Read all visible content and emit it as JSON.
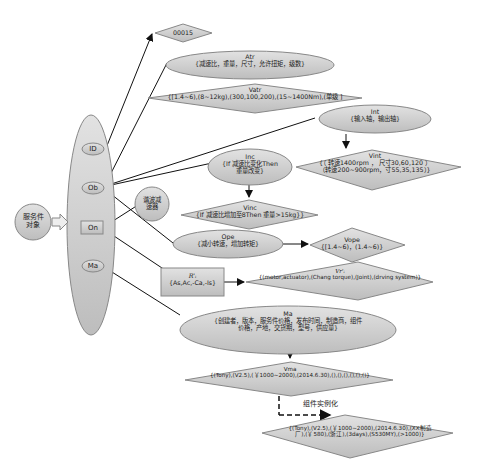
{
  "root": {
    "label": "服务件\n对象",
    "line1": "服务件",
    "line2": "对象"
  },
  "attributes_container": {
    "items": [
      {
        "key": "ID",
        "label": "ID"
      },
      {
        "key": "Ob",
        "label": "Ob"
      },
      {
        "key": "On",
        "label": "On"
      },
      {
        "key": "Ma",
        "label": "Ma"
      }
    ]
  },
  "id_value": {
    "label": "00015"
  },
  "on_value": {
    "line1": "谐波减",
    "line2": "速器"
  },
  "atr": {
    "title": "Atr",
    "text": "{减速比，重量，尺寸，允许扭矩，级数}"
  },
  "vatr": {
    "title": "Vatr",
    "text": "{[1.4~6),(8~12kg),(300,100,200),(15~1400Nm),(单级 ]"
  },
  "int": {
    "title": "Int",
    "text": "{输入轴，输出轴}"
  },
  "vint": {
    "title": "Vint",
    "line1": "{（ 转速1400rpm ， 尺寸30,60,120 ）",
    "line2": "（转速200~900rpm，寸55,35,135）}"
  },
  "inc": {
    "title": "Inc",
    "line1": "{If 减速比变化Then",
    "line2": "重量改变}"
  },
  "vinc": {
    "title": "Vinc",
    "text": "{If 减速比增加至8Then 重量>15kg}}"
  },
  "ope": {
    "title": "Ope",
    "text": "{减小转速，增加转矩}"
  },
  "vope": {
    "title": "Vope",
    "text": "{[1.4~6)，(1.4~6)}"
  },
  "r": {
    "title": "R'ᵢ",
    "text": "{As,Ac,-Ca,-Is}"
  },
  "vr": {
    "title": "Vr'ᵢ",
    "text": "{(motor,actuator),(Chang torque),(Joint),(drving system)}"
  },
  "ma": {
    "title": "Ma",
    "line1": "{创建者，版本，服务件价格，发布时间，制造商，组件",
    "line2": "价格，产地，交货期，型号，供应量}"
  },
  "vma": {
    "title": "Vma",
    "text": "{(Tony),(V2.5),(￥1000~2000),(2014.6.30),(),(),(),(),(),()}"
  },
  "instantiation": {
    "label": "组件实例化"
  },
  "instance": {
    "line1": "{(Tony),(V2.5),(￥1000~2000),(2014.6.30),(XX制造",
    "line2": "厂),(￥580),(浙江),(3days),(S530MY),(>1000)}"
  },
  "colors": {
    "fill": "#cfcfcf",
    "stroke": "#8a8a8a",
    "line": "#111111",
    "background": "#ffffff"
  }
}
